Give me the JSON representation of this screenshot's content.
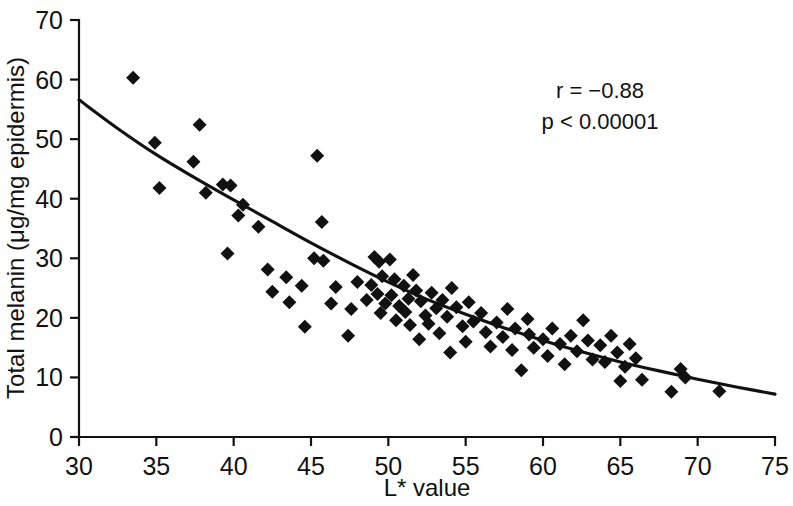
{
  "chart_data": {
    "type": "scatter",
    "title": "",
    "xlabel": "L* value",
    "ylabel": "Total melanin (μg/mg epidermis)",
    "xlim": [
      30,
      75
    ],
    "ylim": [
      0,
      70
    ],
    "xticks": [
      30,
      35,
      40,
      45,
      50,
      55,
      60,
      65,
      70,
      75
    ],
    "yticks": [
      0,
      10,
      20,
      30,
      40,
      50,
      60,
      70
    ],
    "grid": false,
    "legend": null,
    "marker_shape": "filled-diamond",
    "marker_color": "#111111",
    "annotations": [
      {
        "name": "correlation",
        "text": "r = −0.88",
        "x": 63.0,
        "y": 59.0
      },
      {
        "name": "p-value",
        "text": "p < 0.00001",
        "x": 63.0,
        "y": 54.5
      }
    ],
    "series": [
      {
        "name": "Total melanin vs L* value",
        "points": [
          [
            33.5,
            60.3
          ],
          [
            34.9,
            49.4
          ],
          [
            35.2,
            41.8
          ],
          [
            37.8,
            52.4
          ],
          [
            37.4,
            46.2
          ],
          [
            38.2,
            41.0
          ],
          [
            39.3,
            42.4
          ],
          [
            39.8,
            42.2
          ],
          [
            39.6,
            30.8
          ],
          [
            40.6,
            39.0
          ],
          [
            40.3,
            37.2
          ],
          [
            41.6,
            35.3
          ],
          [
            42.2,
            28.1
          ],
          [
            42.5,
            24.4
          ],
          [
            43.4,
            26.8
          ],
          [
            43.6,
            22.6
          ],
          [
            44.4,
            25.4
          ],
          [
            45.4,
            47.2
          ],
          [
            45.7,
            36.1
          ],
          [
            45.2,
            30.0
          ],
          [
            45.8,
            29.6
          ],
          [
            44.6,
            18.5
          ],
          [
            46.3,
            22.4
          ],
          [
            46.6,
            25.2
          ],
          [
            47.6,
            21.5
          ],
          [
            48.0,
            26.0
          ],
          [
            47.4,
            17.0
          ],
          [
            48.6,
            23.0
          ],
          [
            48.9,
            25.5
          ],
          [
            49.1,
            30.2
          ],
          [
            49.4,
            29.4
          ],
          [
            49.6,
            27.0
          ],
          [
            49.3,
            24.0
          ],
          [
            49.8,
            22.4
          ],
          [
            49.5,
            20.8
          ],
          [
            50.1,
            29.8
          ],
          [
            50.4,
            26.5
          ],
          [
            50.2,
            23.8
          ],
          [
            50.7,
            22.0
          ],
          [
            50.5,
            19.6
          ],
          [
            51.0,
            25.4
          ],
          [
            51.3,
            23.2
          ],
          [
            51.1,
            21.0
          ],
          [
            51.6,
            27.2
          ],
          [
            51.8,
            24.6
          ],
          [
            51.4,
            18.8
          ],
          [
            52.1,
            22.8
          ],
          [
            52.4,
            20.4
          ],
          [
            52.0,
            16.4
          ],
          [
            52.8,
            24.2
          ],
          [
            53.1,
            21.6
          ],
          [
            52.6,
            19.0
          ],
          [
            53.5,
            23.0
          ],
          [
            53.3,
            17.4
          ],
          [
            53.8,
            20.2
          ],
          [
            54.1,
            25.0
          ],
          [
            54.4,
            21.8
          ],
          [
            54.0,
            14.2
          ],
          [
            54.8,
            18.6
          ],
          [
            55.2,
            22.6
          ],
          [
            55.5,
            19.4
          ],
          [
            55.0,
            16.0
          ],
          [
            56.0,
            20.8
          ],
          [
            56.3,
            17.6
          ],
          [
            56.6,
            15.2
          ],
          [
            57.0,
            19.2
          ],
          [
            57.4,
            16.8
          ],
          [
            57.7,
            21.5
          ],
          [
            58.2,
            18.2
          ],
          [
            58.0,
            14.6
          ],
          [
            58.6,
            11.2
          ],
          [
            59.1,
            17.2
          ],
          [
            59.4,
            15.0
          ],
          [
            59.0,
            19.8
          ],
          [
            60.0,
            16.4
          ],
          [
            60.3,
            13.6
          ],
          [
            60.6,
            18.2
          ],
          [
            61.1,
            15.6
          ],
          [
            61.4,
            12.2
          ],
          [
            61.8,
            17.0
          ],
          [
            62.2,
            14.4
          ],
          [
            62.6,
            19.6
          ],
          [
            62.9,
            16.2
          ],
          [
            63.2,
            13.0
          ],
          [
            63.7,
            15.4
          ],
          [
            64.0,
            12.6
          ],
          [
            64.4,
            17.0
          ],
          [
            64.8,
            14.2
          ],
          [
            65.0,
            9.4
          ],
          [
            65.3,
            11.8
          ],
          [
            65.6,
            15.6
          ],
          [
            66.0,
            13.2
          ],
          [
            66.4,
            9.6
          ],
          [
            68.3,
            7.6
          ],
          [
            68.9,
            11.4
          ],
          [
            69.2,
            10.0
          ],
          [
            71.4,
            7.7
          ]
        ]
      }
    ],
    "fit_curve": {
      "name": "exponential-decay-trendline",
      "description": "Smooth monotonically decreasing fitted curve",
      "points": [
        [
          30.0,
          56.6
        ],
        [
          32.5,
          51.8
        ],
        [
          35.0,
          47.4
        ],
        [
          37.5,
          43.5
        ],
        [
          40.0,
          39.8
        ],
        [
          42.5,
          36.2
        ],
        [
          45.0,
          32.6
        ],
        [
          47.5,
          29.2
        ],
        [
          50.0,
          26.0
        ],
        [
          52.5,
          23.1
        ],
        [
          55.0,
          20.6
        ],
        [
          57.5,
          18.3
        ],
        [
          60.0,
          16.2
        ],
        [
          62.5,
          14.3
        ],
        [
          65.0,
          12.6
        ],
        [
          67.5,
          11.1
        ],
        [
          70.0,
          9.7
        ],
        [
          72.5,
          8.4
        ],
        [
          75.0,
          7.2
        ]
      ]
    }
  },
  "axis": {
    "x_tick_labels": [
      "30",
      "35",
      "40",
      "45",
      "50",
      "55",
      "60",
      "65",
      "70",
      "75"
    ],
    "y_tick_labels": [
      "0",
      "10",
      "20",
      "30",
      "40",
      "50",
      "60",
      "70"
    ],
    "x_title": "L* value",
    "y_title": "Total melanin (μg/mg epidermis)"
  },
  "annotations": {
    "r_value": "r = −0.88",
    "p_value": "p < 0.00001"
  }
}
